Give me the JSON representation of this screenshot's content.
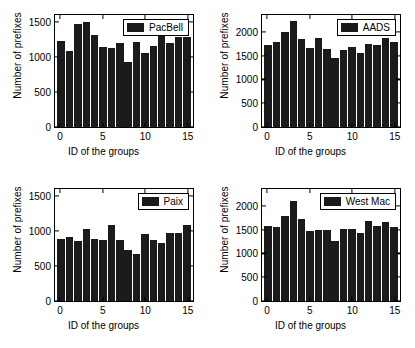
{
  "figure": {
    "background": "#ffffff",
    "bar_color": "#1b1b1b",
    "axis_color": "#000000"
  },
  "chart_data": [
    {
      "type": "bar",
      "title": "",
      "legend_label": "PacBell",
      "legend_position": "top-right",
      "xlabel": "ID of the groups",
      "ylabel": "Number of prefixes",
      "categories": [
        0,
        1,
        2,
        3,
        4,
        5,
        6,
        7,
        8,
        9,
        10,
        11,
        12,
        13,
        14,
        15
      ],
      "values": [
        1225,
        1085,
        1465,
        1500,
        1320,
        1145,
        1135,
        1205,
        930,
        1215,
        1055,
        1160,
        1355,
        1195,
        1280,
        1280
      ],
      "ylim": [
        0,
        1600
      ],
      "yticks": [
        0,
        500,
        1000,
        1500
      ],
      "ytick_labels": [
        "0",
        "500",
        "1000",
        "1500"
      ],
      "xlim": [
        -0.6,
        15.6
      ],
      "xticks": [
        0,
        5,
        10,
        15
      ],
      "xtick_labels": [
        "0",
        "5",
        "10",
        "15"
      ],
      "grid": false
    },
    {
      "type": "bar",
      "title": "",
      "legend_label": "AADS",
      "legend_position": "top-right",
      "xlabel": "ID of the groups",
      "ylabel": "Number of prefixes",
      "categories": [
        0,
        1,
        2,
        3,
        4,
        5,
        6,
        7,
        8,
        9,
        10,
        11,
        12,
        13,
        14,
        15
      ],
      "values": [
        1720,
        1775,
        1990,
        2230,
        1850,
        1665,
        1860,
        1630,
        1440,
        1620,
        1675,
        1545,
        1750,
        1720,
        1865,
        1780
      ],
      "ylim": [
        0,
        2350
      ],
      "yticks": [
        0,
        500,
        1000,
        1500,
        2000
      ],
      "ytick_labels": [
        "0",
        "500",
        "1000",
        "1500",
        "2000"
      ],
      "xlim": [
        -0.6,
        15.6
      ],
      "xticks": [
        0,
        5,
        10,
        15
      ],
      "xtick_labels": [
        "0",
        "5",
        "10",
        "15"
      ],
      "grid": false
    },
    {
      "type": "bar",
      "title": "",
      "legend_label": "Paix",
      "legend_position": "top-right",
      "xlabel": "ID of the groups",
      "ylabel": "Number of prefixes",
      "categories": [
        0,
        1,
        2,
        3,
        4,
        5,
        6,
        7,
        8,
        9,
        10,
        11,
        12,
        13,
        14,
        15
      ],
      "values": [
        885,
        915,
        860,
        1035,
        890,
        865,
        1090,
        865,
        735,
        665,
        960,
        865,
        835,
        975,
        975,
        1090
      ],
      "ylim": [
        0,
        1600
      ],
      "yticks": [
        0,
        500,
        1000,
        1500
      ],
      "ytick_labels": [
        "0",
        "500",
        "1000",
        "1500"
      ],
      "xlim": [
        -0.6,
        15.6
      ],
      "xticks": [
        0,
        5,
        10,
        15
      ],
      "xtick_labels": [
        "0",
        "5",
        "10",
        "15"
      ],
      "grid": false
    },
    {
      "type": "bar",
      "title": "",
      "legend_label": "West Mac",
      "legend_position": "top-right",
      "xlabel": "ID of the groups",
      "ylabel": "Number of prefixes",
      "categories": [
        0,
        1,
        2,
        3,
        4,
        5,
        6,
        7,
        8,
        9,
        10,
        11,
        12,
        13,
        14,
        15
      ],
      "values": [
        1570,
        1545,
        1790,
        2100,
        1715,
        1470,
        1490,
        1495,
        1250,
        1505,
        1510,
        1435,
        1670,
        1565,
        1650,
        1560
      ],
      "ylim": [
        0,
        2350
      ],
      "yticks": [
        0,
        500,
        1000,
        1500,
        2000
      ],
      "ytick_labels": [
        "0",
        "500",
        "1000",
        "1500",
        "2000"
      ],
      "xlim": [
        -0.6,
        15.6
      ],
      "xticks": [
        0,
        5,
        10,
        15
      ],
      "xtick_labels": [
        "0",
        "5",
        "10",
        "15"
      ],
      "grid": false
    }
  ]
}
